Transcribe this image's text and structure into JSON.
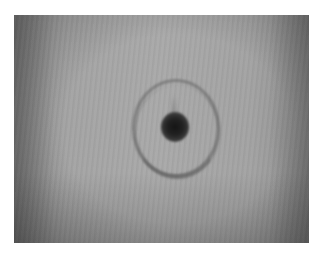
{
  "image": {
    "description": "Grayscale photograph of a dark central spot surrounded by a faint circular ring on a uniform gray background",
    "frame": {
      "left": 14,
      "top": 15,
      "width": 295,
      "height": 228
    },
    "background_color": "#ffffff",
    "photo_base_color": "#a6a6a6",
    "ring_color": "#5f5f5f",
    "spot_color": "#151515"
  }
}
